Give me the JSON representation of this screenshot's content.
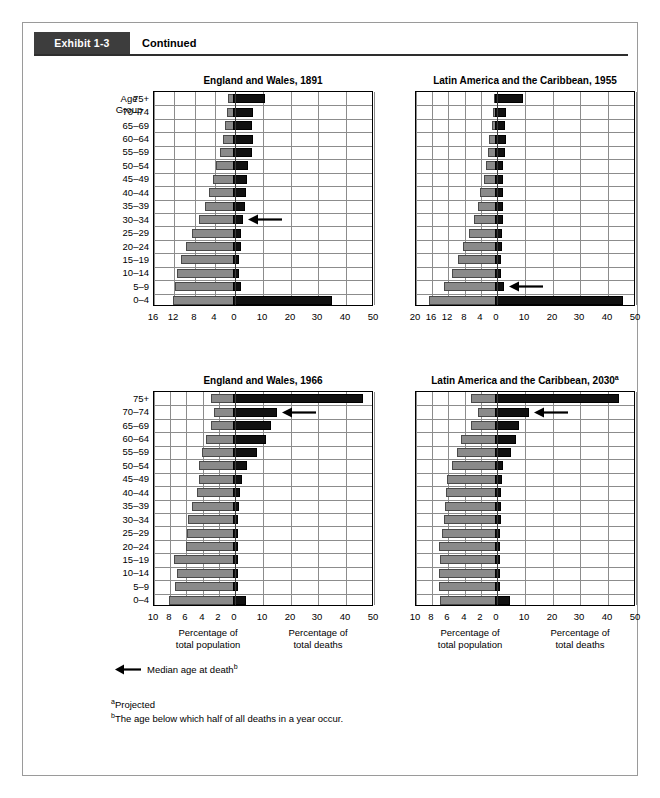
{
  "exhibit": {
    "tag": "Exhibit 1-3",
    "continued": "Continued"
  },
  "age_header": {
    "line1": "Age",
    "line2": "Group"
  },
  "axis_captions": {
    "population_line1": "Percentage of",
    "population_line2": "total population",
    "deaths_line1": "Percentage of",
    "deaths_line2": "total deaths"
  },
  "legend": {
    "label": "Median age at death",
    "marker": "b"
  },
  "footnotes": [
    {
      "marker": "a",
      "text": "Projected"
    },
    {
      "marker": "b",
      "text": "The age below which half of all deaths in a year occur."
    }
  ],
  "colors": {
    "population_bar": "#8a8a8a",
    "deaths_bar": "#111111",
    "grid": "#8c8c8c",
    "axis": "#000000",
    "exhibit_tag_bg": "#3d3d3d"
  },
  "age_groups": [
    "75+",
    "70–74",
    "65–69",
    "60–64",
    "55–59",
    "50–54",
    "45–49",
    "40–44",
    "35–39",
    "30–34",
    "25–29",
    "20–24",
    "15–19",
    "10–14",
    "5–9",
    "0–4"
  ],
  "chart_data": [
    {
      "id": "england-wales-1891",
      "type": "bar",
      "orientation": "horizontal",
      "layout": "population-pyramid-back-to-back",
      "title": "England and Wales, 1891",
      "title_superscript": "",
      "ylabel": "Age Group",
      "categories": [
        "75+",
        "70–74",
        "65–69",
        "60–64",
        "55–59",
        "50–54",
        "45–49",
        "40–44",
        "35–39",
        "30–34",
        "25–29",
        "20–24",
        "15–19",
        "10–14",
        "5–9",
        "0–4"
      ],
      "left_axis": {
        "label": "Percentage of total population",
        "ticks": [
          16,
          12,
          8,
          4,
          0
        ],
        "max": 16,
        "step": 4
      },
      "right_axis": {
        "label": "Percentage of total deaths",
        "ticks": [
          0,
          10,
          20,
          30,
          40,
          50
        ],
        "max": 50,
        "step": 10
      },
      "grid": true,
      "series": [
        {
          "name": "Percentage of total population",
          "side": "left",
          "color": "#8a8a8a",
          "values": [
            1.3,
            1.5,
            2.0,
            2.4,
            3.0,
            3.7,
            4.4,
            5.2,
            6.0,
            7.1,
            8.4,
            9.6,
            10.7,
            11.5,
            11.8,
            12.3
          ]
        },
        {
          "name": "Percentage of total deaths",
          "side": "right",
          "color": "#111111",
          "values": [
            10.8,
            6.5,
            6.2,
            6.5,
            6.0,
            4.7,
            4.3,
            3.8,
            3.5,
            3.0,
            2.3,
            2.0,
            1.6,
            1.3,
            2.0,
            35.0
          ]
        }
      ],
      "median_age_at_death_marker": {
        "category": "30–34"
      }
    },
    {
      "id": "latin-america-caribbean-1955",
      "type": "bar",
      "orientation": "horizontal",
      "layout": "population-pyramid-back-to-back",
      "title": "Latin America and the Caribbean, 1955",
      "title_superscript": "",
      "ylabel": "Age Group",
      "categories": [
        "75+",
        "70–74",
        "65–69",
        "60–64",
        "55–59",
        "50–54",
        "45–49",
        "40–44",
        "35–39",
        "30–34",
        "25–29",
        "20–24",
        "15–19",
        "10–14",
        "5–9",
        "0–4"
      ],
      "left_axis": {
        "label": "Percentage of total population",
        "ticks": [
          20,
          16,
          12,
          8,
          4,
          0
        ],
        "max": 20,
        "step": 4
      },
      "right_axis": {
        "label": "Percentage of total deaths",
        "ticks": [
          0,
          10,
          20,
          30,
          40,
          50
        ],
        "max": 50,
        "step": 10
      },
      "grid": true,
      "series": [
        {
          "name": "Percentage of total population",
          "side": "left",
          "color": "#8a8a8a",
          "values": [
            0.8,
            1.0,
            1.3,
            1.9,
            2.3,
            2.8,
            3.3,
            4.3,
            4.8,
            5.8,
            7.0,
            8.3,
            9.7,
            11.2,
            13.0,
            16.8
          ]
        },
        {
          "name": "Percentage of total deaths",
          "side": "right",
          "color": "#111111",
          "values": [
            9.5,
            3.2,
            3.0,
            3.2,
            3.0,
            2.3,
            2.3,
            2.0,
            2.0,
            2.0,
            1.8,
            1.8,
            1.6,
            1.6,
            2.5,
            45.5
          ]
        }
      ],
      "median_age_at_death_marker": {
        "category": "5–9"
      }
    },
    {
      "id": "england-wales-1966",
      "type": "bar",
      "orientation": "horizontal",
      "layout": "population-pyramid-back-to-back",
      "title": "England and Wales, 1966",
      "title_superscript": "",
      "ylabel": "Age Group",
      "categories": [
        "75+",
        "70–74",
        "65–69",
        "60–64",
        "55–59",
        "50–54",
        "45–49",
        "40–44",
        "35–39",
        "30–34",
        "25–29",
        "20–24",
        "15–19",
        "10–14",
        "5–9",
        "0–4"
      ],
      "left_axis": {
        "label": "Percentage of total population",
        "ticks": [
          10,
          8,
          6,
          4,
          2,
          0
        ],
        "max": 10,
        "step": 2
      },
      "right_axis": {
        "label": "Percentage of total deaths",
        "ticks": [
          0,
          10,
          20,
          30,
          40,
          50
        ],
        "max": 50,
        "step": 10
      },
      "grid": true,
      "series": [
        {
          "name": "Percentage of total population",
          "side": "left",
          "color": "#8a8a8a",
          "values": [
            3.0,
            2.6,
            3.0,
            3.6,
            4.1,
            4.4,
            4.5,
            4.7,
            5.3,
            5.8,
            5.9,
            6.1,
            7.5,
            7.1,
            7.4,
            8.2
          ]
        },
        {
          "name": "Percentage of total deaths",
          "side": "right",
          "color": "#111111",
          "values": [
            46.0,
            15.0,
            13.0,
            11.0,
            8.0,
            4.2,
            2.5,
            1.8,
            1.4,
            1.2,
            1.0,
            1.0,
            0.9,
            0.8,
            0.8,
            4.0
          ]
        }
      ],
      "median_age_at_death_marker": {
        "category": "70–74"
      }
    },
    {
      "id": "latin-america-caribbean-2030",
      "type": "bar",
      "orientation": "horizontal",
      "layout": "population-pyramid-back-to-back",
      "title": "Latin America and the Caribbean, 2030",
      "title_superscript": "a",
      "ylabel": "Age Group",
      "categories": [
        "75+",
        "70–74",
        "65–69",
        "60–64",
        "55–59",
        "50–54",
        "45–49",
        "40–44",
        "35–39",
        "30–34",
        "25–29",
        "20–24",
        "15–19",
        "10–14",
        "5–9",
        "0–4"
      ],
      "left_axis": {
        "label": "Percentage of total population",
        "ticks": [
          10,
          8,
          6,
          4,
          2,
          0
        ],
        "max": 10,
        "step": 2
      },
      "right_axis": {
        "label": "Percentage of total deaths",
        "ticks": [
          0,
          10,
          20,
          30,
          40,
          50
        ],
        "max": 50,
        "step": 10
      },
      "grid": true,
      "series": [
        {
          "name": "Percentage of total population",
          "side": "left",
          "color": "#8a8a8a",
          "values": [
            3.2,
            2.4,
            3.2,
            4.4,
            5.0,
            5.6,
            6.2,
            6.3,
            6.4,
            6.6,
            6.8,
            7.2,
            7.0,
            7.1,
            7.2,
            7.0
          ]
        },
        {
          "name": "Percentage of total deaths",
          "side": "right",
          "color": "#111111",
          "values": [
            44.0,
            11.5,
            8.0,
            7.0,
            5.0,
            2.2,
            1.8,
            1.6,
            1.4,
            1.3,
            1.2,
            1.2,
            1.1,
            1.0,
            1.0,
            4.5
          ]
        }
      ],
      "median_age_at_death_marker": {
        "category": "70–74"
      }
    }
  ]
}
